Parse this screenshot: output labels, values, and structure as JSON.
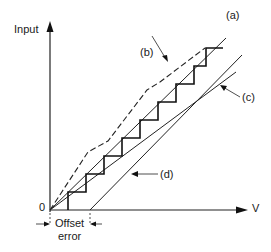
{
  "diagram": {
    "y_axis_label": "Input",
    "x_axis_label": "V",
    "origin_label": "0",
    "offset_label_line1": "Offset",
    "offset_label_line2": "error",
    "curves": [
      {
        "id": "a",
        "label": "(a)",
        "description": "ideal straight line"
      },
      {
        "id": "b",
        "label": "(b)",
        "description": "dashed nonlinear curve"
      },
      {
        "id": "c",
        "label": "(c)",
        "description": "gain error line"
      },
      {
        "id": "d",
        "label": "(d)",
        "description": "offset error line"
      }
    ],
    "staircase": "quantized transfer steps"
  }
}
